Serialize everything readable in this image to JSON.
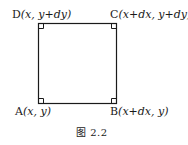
{
  "figure": {
    "caption": "图 2.2",
    "shape": "square",
    "vertices": {
      "D": {
        "name": "D",
        "coords": "(x, y+dy)"
      },
      "C": {
        "name": "C",
        "coords": "(x+dx, y+dy)"
      },
      "A": {
        "name": "A",
        "coords": "(x, y)"
      },
      "B": {
        "name": "B",
        "coords": "(x+dx, y)"
      }
    },
    "right_angle_markers": 4,
    "colors": {
      "stroke": "#1a1a1a",
      "background": "#ffffff"
    }
  }
}
